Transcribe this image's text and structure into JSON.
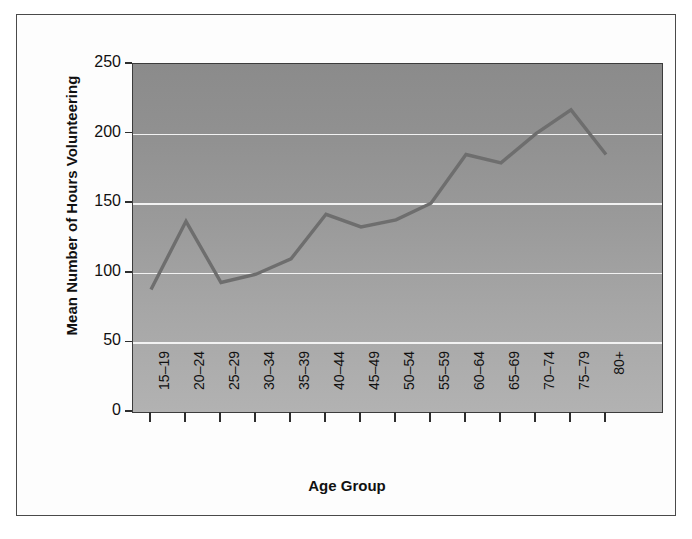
{
  "chart_data": {
    "type": "line",
    "title": "",
    "xlabel": "Age Group",
    "ylabel": "Mean Number of Hours Volunteering",
    "categories": [
      "15–19",
      "20–24",
      "25–29",
      "30–34",
      "35–39",
      "40–44",
      "45–49",
      "50–54",
      "55–59",
      "60–64",
      "65–69",
      "70–74",
      "75–79",
      "80+"
    ],
    "values": [
      88,
      137,
      93,
      99,
      110,
      142,
      133,
      138,
      150,
      185,
      179,
      200,
      217,
      185
    ],
    "series": [
      {
        "name": "Mean hours volunteering",
        "values": [
          88,
          137,
          93,
          99,
          110,
          142,
          133,
          138,
          150,
          185,
          179,
          200,
          217,
          185
        ]
      }
    ],
    "ylim": [
      0,
      250
    ],
    "yticks": [
      0,
      50,
      100,
      150,
      200,
      250
    ],
    "ytick_labels": [
      "0",
      "50",
      "100",
      "150",
      "200",
      "250"
    ],
    "grid": "horizontal",
    "gridline_values": [
      50,
      100,
      150,
      200
    ],
    "legend": "none",
    "line_color": "#6e6e6e",
    "plot_bg_top": "#8b8b8b",
    "plot_bg_bottom": "#b2b2b2",
    "gridline_color": "#f2f2f2",
    "axis_color": "#2e2e2e",
    "frame_color": "#4a4a4a"
  }
}
